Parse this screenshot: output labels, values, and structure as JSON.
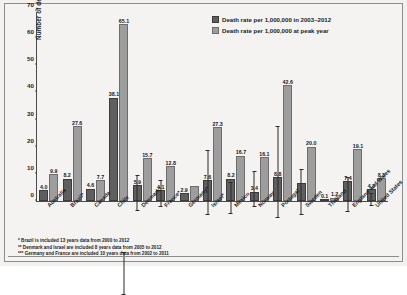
{
  "chart_data": {
    "type": "bar",
    "title": "",
    "xlabel": "",
    "ylabel": "Number of deaths at peak year",
    "ylim": [
      0,
      70
    ],
    "yticks": [
      0,
      10,
      20,
      30,
      40,
      50,
      60,
      70
    ],
    "grid": false,
    "legend_position": "top-right",
    "categories": [
      "Australia",
      "Brazil*",
      "Canada",
      "Chile",
      "Denmark*",
      "France*",
      "Germany*",
      "Israel*",
      "Mexico",
      "Norway",
      "Portugal",
      "Sweden",
      "Thailand",
      "England and Wales",
      "United States"
    ],
    "series": [
      {
        "name": "Death rate per 1,000,000 in 2003–2012",
        "values": [
          4.0,
          8.2,
          4.6,
          38.1,
          5.9,
          4.1,
          2.9,
          7.6,
          8.2,
          3.4,
          8.8,
          6.6,
          0.1,
          7.4,
          4.3
        ],
        "labels": [
          "4.0",
          "8.2",
          "4.6",
          "38.1",
          "5.9",
          "4.1",
          "2.9",
          "7.6",
          "8.2",
          "3.4",
          "8.8",
          "",
          "0.1",
          "7.4",
          "4.3"
        ]
      },
      {
        "name": "Death rate per 1,000,000 at peak year",
        "values": [
          9.9,
          27.6,
          7.7,
          65.1,
          15.7,
          12.8,
          5.6,
          27.3,
          16.7,
          16.1,
          42.6,
          20.0,
          1.2,
          19.1,
          8.3
        ],
        "labels": [
          "9.9",
          "27.6",
          "7.7",
          "65.1",
          "15.7",
          "12.8",
          "",
          "27.3",
          "16.7",
          "16.1",
          "42.6",
          "20.0",
          "1.2",
          "19.1",
          "8.3"
        ]
      }
    ],
    "error_bars": {
      "note": "vertical whisker lines drawn on selected bars",
      "entries": [
        {
          "category": "Chile",
          "series": 1,
          "low": 30.0,
          "high": 46.0
        },
        {
          "category": "Denmark*",
          "series": 0,
          "low": 2.0,
          "high": 15.0
        },
        {
          "category": "France*",
          "series": 0,
          "low": 1.5,
          "high": 11.5
        },
        {
          "category": "Israel*",
          "series": 0,
          "low": 2.0,
          "high": 26.0
        },
        {
          "category": "Mexico",
          "series": 0,
          "low": 3.0,
          "high": 15.0
        },
        {
          "category": "Norway",
          "series": 0,
          "low": 1.0,
          "high": 14.0
        },
        {
          "category": "Portugal",
          "series": 0,
          "low": 2.0,
          "high": 36.0
        },
        {
          "category": "Sweden",
          "series": 0,
          "low": 1.0,
          "high": 18.0
        },
        {
          "category": "England and Wales",
          "series": 0,
          "low": 3.0,
          "high": 16.0
        },
        {
          "category": "United States",
          "series": 0,
          "low": 2.0,
          "high": 7.0
        }
      ]
    }
  },
  "legend": {
    "items": [
      {
        "label": "Death rate per 1,000,000 in 2003–2012",
        "color": "#5f5f5f"
      },
      {
        "label": "Death rate per 1,000,000 at peak year",
        "color": "#9d9d9d"
      }
    ]
  },
  "footnotes": [
    "* Brazil is included 13 years data from 2000 to 2012",
    "** Denmark and Israel are included 8 years data from 2005 to 2012",
    "*** Germany and France are included 10 years data from 2002 to 2011"
  ]
}
